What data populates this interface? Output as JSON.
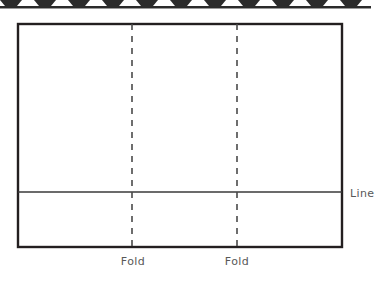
{
  "diagram": {
    "sheet": {
      "name": "sheet-rectangle",
      "x": 18,
      "y": 24,
      "width": 324,
      "height": 223,
      "stroke_color": "#231f20",
      "stroke_width": 2.4,
      "fill_color": "#ffffff"
    },
    "horizontal_line": {
      "name": "horizontal-line",
      "y": 192,
      "x1": 18,
      "x2": 342,
      "stroke_color": "#3a3a3a",
      "stroke_width": 1.3,
      "label": "Line"
    },
    "fold_lines": [
      {
        "name": "fold-line-left",
        "x": 132,
        "y1": 24,
        "y2": 247,
        "label": "Fold",
        "dash": "6 6",
        "stroke_color": "#4a4a4a",
        "stroke_width": 1.6
      },
      {
        "name": "fold-line-right",
        "x": 237,
        "y1": 24,
        "y2": 247,
        "label": "Fold",
        "dash": "6 6",
        "stroke_color": "#4a4a4a",
        "stroke_width": 1.6
      }
    ],
    "labels": {
      "line": "Line",
      "fold_left": "Fold",
      "fold_right": "Fold"
    },
    "top_strip": {
      "name": "cropped-image-strip",
      "description": "cut-off row of dark trapezoid shapes",
      "shape_count": 11,
      "shape_color": "#2b2b2b",
      "background_color": "#ffffff"
    }
  }
}
